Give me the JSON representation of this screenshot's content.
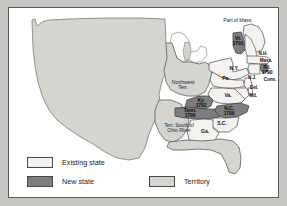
{
  "figure": {
    "type": "historical-map",
    "background_color": "#c8c6c2",
    "panel_color": "#ffffff"
  },
  "colors": {
    "existing_state": "#f4f2ee",
    "new_state": "#7e7e7e",
    "territory": "#d6d4cf",
    "outline": "#4a4a4a",
    "text": "#111111"
  },
  "map": {
    "annotations": [
      {
        "id": "part-of-mass",
        "text": "Part of Mass.",
        "x": 229,
        "y": 13,
        "style": "terr"
      },
      {
        "id": "northwest-terr",
        "text": "Northwest\nTerr.",
        "x": 174,
        "y": 77,
        "style": "terr"
      },
      {
        "id": "terr-south-ohio",
        "text": "Terr. South of\nOhio River",
        "x": 170,
        "y": 120,
        "style": "terr"
      }
    ],
    "new_states": [
      {
        "id": "vermont",
        "label": "Vt.",
        "year": "1791",
        "x": 229,
        "y": 33
      },
      {
        "id": "rhode-island",
        "label": "R.I.",
        "year": "1790",
        "x": 258,
        "y": 62
      },
      {
        "id": "kentucky",
        "label": "Ky.",
        "year": "1792",
        "x": 192,
        "y": 95
      },
      {
        "id": "tennessee",
        "label": "Tenn.",
        "year": "1796",
        "x": 181,
        "y": 105
      },
      {
        "id": "north-carolina",
        "label": "N.C.",
        "year": "1789",
        "x": 220,
        "y": 103
      }
    ],
    "existing_states": [
      {
        "id": "new-hampshire",
        "label": "N.H.",
        "x": 254,
        "y": 46
      },
      {
        "id": "massachusetts",
        "label": "Mass.",
        "x": 257,
        "y": 53
      },
      {
        "id": "new-york",
        "label": "N.Y.",
        "x": 225,
        "y": 61
      },
      {
        "id": "connecticut",
        "label": "Conn.",
        "x": 261,
        "y": 72
      },
      {
        "id": "new-jersey",
        "label": "N.J.",
        "x": 243,
        "y": 70
      },
      {
        "id": "pennsylvania",
        "label": "Pa.",
        "x": 217,
        "y": 71
      },
      {
        "id": "delaware",
        "label": "Del.",
        "x": 245,
        "y": 80
      },
      {
        "id": "maryland",
        "label": "Md.",
        "x": 244,
        "y": 88
      },
      {
        "id": "virginia",
        "label": "Va.",
        "x": 219,
        "y": 88
      },
      {
        "id": "south-carolina",
        "label": "S.C.",
        "x": 213,
        "y": 116
      },
      {
        "id": "georgia",
        "label": "Ga.",
        "x": 196,
        "y": 124
      }
    ]
  },
  "legend": {
    "items": [
      {
        "id": "existing-state",
        "label": "Existing state",
        "swatch": "existing"
      },
      {
        "id": "new-state",
        "label": "New state",
        "swatch": "new"
      },
      {
        "id": "territory",
        "label": "Territory",
        "swatch": "territory"
      }
    ]
  }
}
